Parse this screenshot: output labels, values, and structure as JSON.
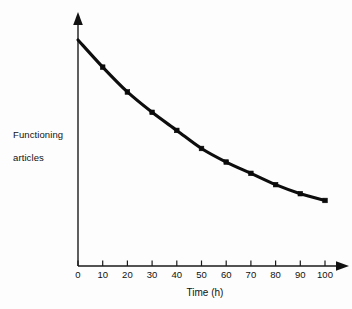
{
  "chart_data": {
    "type": "line",
    "title": "",
    "xlabel": "Time (h)",
    "ylabel": "Functioning articles",
    "x": [
      0,
      10,
      20,
      30,
      40,
      50,
      60,
      70,
      80,
      90,
      100
    ],
    "values": [
      100,
      88,
      77,
      68,
      60,
      52,
      46,
      41,
      36,
      32,
      29
    ],
    "xticklabels": [
      "0",
      "10",
      "20",
      "30",
      "40",
      "50",
      "60",
      "70",
      "80",
      "90",
      "100"
    ],
    "yticklabels": [],
    "xlim": [
      0,
      105
    ],
    "ylim": [
      0,
      100
    ],
    "grid": false,
    "legend": null,
    "marker": "square",
    "series_color": "#0a0a0a",
    "axis_color": "#1a1a1a",
    "annotations": []
  },
  "axes": {
    "x_title": "Time (h)",
    "y_title_line1": "Functioning",
    "y_title_line2": "articles",
    "x_tick_labels": [
      "0",
      "10",
      "20",
      "30",
      "40",
      "50",
      "60",
      "70",
      "80",
      "90",
      "100"
    ]
  },
  "style": {
    "background": "#fdfdfd",
    "ink": "#111111"
  }
}
